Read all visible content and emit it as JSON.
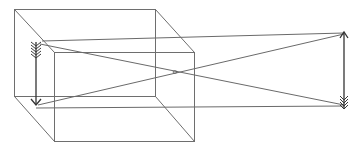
{
  "diagram": {
    "title": "Pinhole camera (camera obscura) image inversion",
    "colors": {
      "background": "#ffffff",
      "box_edge": "#6e6e6e",
      "ray": "#6a6a6a",
      "arrow": "#333333"
    },
    "box": {
      "back_face": {
        "x1": 14,
        "y1": 9,
        "x2": 155,
        "y2": 96
      },
      "front_face": {
        "x1": 54,
        "y1": 52,
        "x2": 194,
        "y2": 141
      }
    },
    "pinhole": {
      "x": 175,
      "y": 72
    },
    "object_arrow": {
      "x": 344,
      "head_y": 33,
      "tail_y": 106,
      "head": "top",
      "fletching": "bottom"
    },
    "image_arrow": {
      "x": 36,
      "tail_y": 44,
      "head_y": 105,
      "head": "bottom",
      "fletching": "top"
    },
    "elements": [
      {
        "id": "camera-box",
        "label": "Camera box"
      },
      {
        "id": "pinhole",
        "label": "Pinhole"
      },
      {
        "id": "object-arrow",
        "label": "Object (upright arrow)"
      },
      {
        "id": "image-arrow",
        "label": "Inverted image"
      },
      {
        "id": "light-rays",
        "label": "Light rays"
      }
    ]
  }
}
